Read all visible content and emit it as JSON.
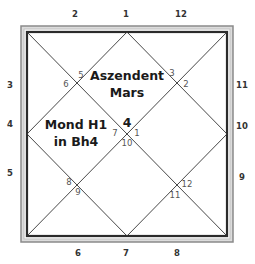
{
  "chart": {
    "outer_numbers": {
      "top": [
        "2",
        "1",
        "12"
      ],
      "left": [
        "3",
        "4",
        "5"
      ],
      "right": [
        "11",
        "10",
        "9"
      ],
      "bottom": [
        "6",
        "7",
        "8"
      ]
    },
    "inner_numbers": {
      "upper_left": [
        "5",
        "6"
      ],
      "upper_right": [
        "3",
        "2"
      ],
      "center": [
        "7",
        "1",
        "10"
      ],
      "lower_left": [
        "8",
        "9"
      ],
      "lower_right": [
        "12",
        "11"
      ]
    },
    "center_house": "4",
    "top_house_label": {
      "line1": "Aszendent",
      "line2": "Mars"
    },
    "left_house_label": {
      "line1": "Mond H1",
      "line2": "in Bh4"
    },
    "colors": {
      "frame_outer": "#8a8a8a",
      "frame_inner": "#2b2b2b",
      "lines": "#333333"
    }
  }
}
